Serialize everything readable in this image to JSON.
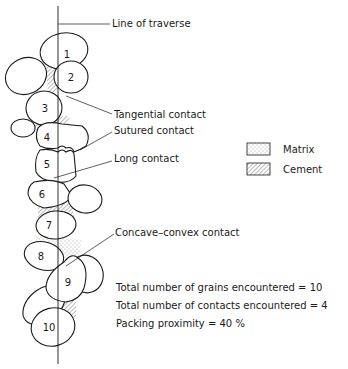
{
  "diagram": {
    "traverse_label": "Line of traverse",
    "contacts": {
      "tangential": "Tangential contact",
      "sutured": "Sutured contact",
      "long": "Long contact",
      "concave_convex": "Concave–convex contact"
    },
    "legend": {
      "matrix": "Matrix",
      "cement": "Cement"
    },
    "grains": [
      "1",
      "2",
      "3",
      "4",
      "5",
      "6",
      "7",
      "8",
      "9",
      "10"
    ],
    "stats": {
      "grains": "Total number of grains encountered = 10",
      "contacts": "Total number of contacts encountered = 4",
      "packing": "Packing proximity = 40 %"
    }
  }
}
